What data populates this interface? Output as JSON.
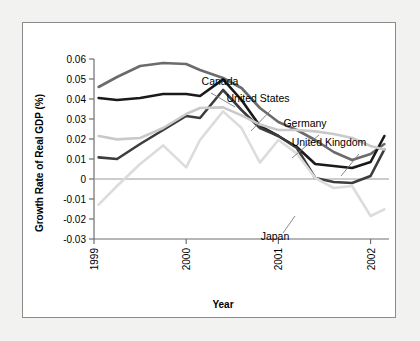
{
  "figure": {
    "background": "#ffffff",
    "page_background": "#f2f2f0",
    "border_color": "#8b8b8b"
  },
  "chart_data": {
    "type": "line",
    "title": "",
    "xlabel": "Year",
    "ylabel": "Growth Rate of Real GDP (%)",
    "xlim": [
      1999.0,
      2002.2
    ],
    "ylim": [
      -0.03,
      0.06
    ],
    "xticks": [
      "1999",
      "2000",
      "2001",
      "2002"
    ],
    "xtick_values": [
      1999,
      2000,
      2001,
      2002
    ],
    "yticks": [
      "0.06",
      "0.05",
      "0.04",
      "0.03",
      "0.02",
      "0.01",
      "0",
      "-0.01",
      "-0.02",
      "-0.03"
    ],
    "ytick_values": [
      0.06,
      0.05,
      0.04,
      0.03,
      0.02,
      0.01,
      0,
      -0.01,
      -0.02,
      -0.03
    ],
    "grid": false,
    "zero_line": true,
    "legend": "inline-annotations",
    "x": [
      1999.05,
      1999.25,
      1999.5,
      1999.75,
      2000.0,
      2000.15,
      2000.4,
      2000.6,
      2000.8,
      2001.0,
      2001.2,
      2001.4,
      2001.6,
      2001.8,
      2002.0,
      2002.15
    ],
    "series": [
      {
        "name": "Canada",
        "color": "#6b6b6b",
        "width": 2.6,
        "values": [
          0.046,
          0.051,
          0.0565,
          0.058,
          0.0575,
          0.0545,
          0.0505,
          0.0455,
          0.0355,
          0.0285,
          0.0245,
          0.0195,
          0.0135,
          0.0095,
          0.0125,
          0.0175
        ]
      },
      {
        "name": "United States",
        "color": "#1a1a1a",
        "width": 2.6,
        "values": [
          0.0405,
          0.0395,
          0.0405,
          0.0425,
          0.0425,
          0.0415,
          0.0498,
          0.0395,
          0.0265,
          0.0215,
          0.016,
          0.0075,
          0.0065,
          0.0055,
          0.0085,
          0.0215
        ]
      },
      {
        "name": "Germany",
        "color": "#3d3d3d",
        "width": 2.6,
        "values": [
          0.0108,
          0.01,
          0.0175,
          0.0245,
          0.0315,
          0.0305,
          0.0445,
          0.0345,
          0.0255,
          0.0215,
          0.0155,
          0.0005,
          -0.0015,
          -0.002,
          0.0015,
          0.0148
        ]
      },
      {
        "name": "United Kingdom",
        "color": "#c9c9c9",
        "width": 2.6,
        "values": [
          0.0215,
          0.0198,
          0.0205,
          0.0255,
          0.0325,
          0.0355,
          0.0358,
          0.0318,
          0.0272,
          0.0245,
          0.0245,
          0.0238,
          0.0225,
          0.0205,
          0.0165,
          0.0148
        ]
      },
      {
        "name": "Japan",
        "color": "#dcdcdc",
        "width": 2.6,
        "values": [
          -0.0128,
          -0.0035,
          0.0075,
          0.0168,
          0.0058,
          0.0195,
          0.0338,
          0.0255,
          0.0082,
          0.0195,
          0.0128,
          0.0005,
          -0.0045,
          -0.0035,
          -0.0185,
          -0.0152
        ]
      }
    ],
    "annotations": [
      {
        "name": "Canada",
        "label": "Canada",
        "x": 197,
        "y": 62,
        "leader": [
          [
            188,
            70
          ],
          [
            212,
            84
          ]
        ]
      },
      {
        "name": "United States",
        "label": "United States",
        "x": 235,
        "y": 79,
        "leader": [
          [
            248,
            87
          ],
          [
            228,
            108
          ]
        ]
      },
      {
        "name": "Germany",
        "label": "Germany",
        "x": 282,
        "y": 104,
        "leader": [
          [
            296,
            112
          ],
          [
            269,
            135
          ]
        ]
      },
      {
        "name": "United Kingdom",
        "label": "United Kingdom",
        "x": 306,
        "y": 123,
        "leader": [
          [
            336,
            131
          ],
          [
            318,
            153
          ]
        ]
      },
      {
        "name": "Japan",
        "label": "Japan",
        "x": 252,
        "y": 217,
        "leader": [
          [
            260,
            210
          ],
          [
            272,
            193
          ]
        ]
      }
    ]
  }
}
